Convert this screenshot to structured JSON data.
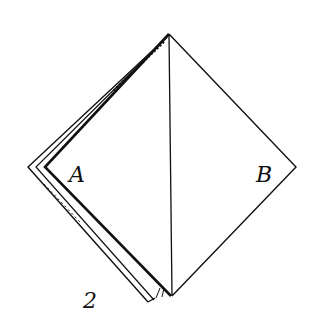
{
  "figure": {
    "step_number": "2",
    "labels": {
      "left_region": "A",
      "right_region": "B"
    }
  },
  "colors": {
    "ink": "#111111",
    "paper": "#ffffff"
  }
}
